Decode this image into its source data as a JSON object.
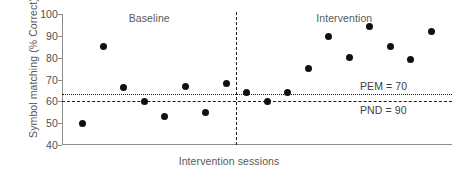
{
  "chart_data": {
    "type": "scatter",
    "title": "",
    "xlabel": "Intervention sessions",
    "ylabel": "Symbol matching (% Correct)",
    "ylim": [
      40,
      100
    ],
    "yticks": [
      100,
      90,
      80,
      70,
      60,
      50,
      40
    ],
    "ytick_labels": [
      "100",
      "90",
      "80",
      "70",
      "60",
      "50",
      "40"
    ],
    "xlim": [
      0,
      19
    ],
    "xticks": [],
    "xtick_labels": [],
    "grid": false,
    "legend": false,
    "phases": [
      {
        "name": "Baseline",
        "label": "Baseline",
        "x_start": 0,
        "x_end": 8.5
      },
      {
        "name": "Intervention",
        "label": "Intervention",
        "x_start": 8.5,
        "x_end": 19
      }
    ],
    "phase_divider_x": 8.5,
    "series": [
      {
        "name": "Symbol matching (% Correct)",
        "marker": "filled-circle",
        "color": "#101010",
        "x": [
          1,
          2,
          3,
          4,
          5,
          6,
          7,
          8,
          9,
          10,
          11,
          12,
          13,
          14,
          15,
          16,
          17,
          18
        ],
        "values": [
          50,
          85,
          66.5,
          60,
          53,
          67,
          55,
          68,
          64,
          60,
          64,
          75,
          89.5,
          80,
          94.5,
          85,
          79,
          92
        ],
        "phase_of_point": [
          "Baseline",
          "Baseline",
          "Baseline",
          "Baseline",
          "Baseline",
          "Baseline",
          "Baseline",
          "Baseline",
          "Intervention",
          "Intervention",
          "Intervention",
          "Intervention",
          "Intervention",
          "Intervention",
          "Intervention",
          "Intervention",
          "Intervention",
          "Intervention"
        ]
      }
    ],
    "reference_lines": [
      {
        "id": "pem",
        "label": "PEM = 70",
        "value": 63.5,
        "style": "dotted",
        "color": "#1b1b1b",
        "label_position": "above-right"
      },
      {
        "id": "pnd",
        "label": "PND = 90",
        "value": 60,
        "style": "dashed",
        "color": "#1b1b1b",
        "label_position": "below-right"
      }
    ],
    "annotations": [
      {
        "id": "pem-annotation",
        "text": "PEM = 70"
      },
      {
        "id": "pnd-annotation",
        "text": "PND = 90"
      }
    ]
  }
}
